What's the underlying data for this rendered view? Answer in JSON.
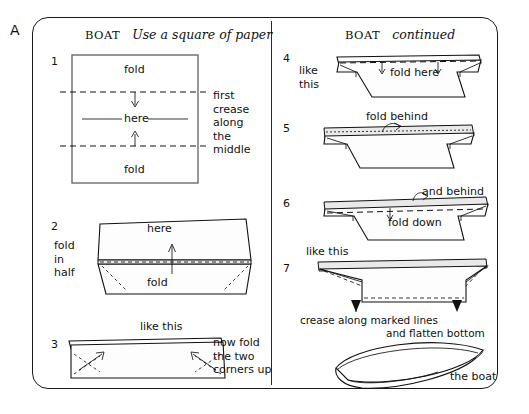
{
  "figure": {
    "label": "A",
    "type": "instructional-diagram"
  },
  "left_page": {
    "header": {
      "name": "BOAT",
      "subtitle": "Use a square of paper"
    },
    "steps": [
      {
        "number": "1",
        "diagram": "square-sheet-with-two-fold-lines",
        "labels": [
          {
            "text": "fold",
            "role": "top-fold-label"
          },
          {
            "text": "here",
            "role": "middle-crease-label"
          },
          {
            "text": "fold",
            "role": "bottom-fold-label"
          }
        ],
        "side_note": "first\ncrease\nalong\nthe\nmiddle"
      },
      {
        "number": "2",
        "diagram": "folded-in-half-strip",
        "side_note": "fold\nin\nhalf",
        "labels": [
          {
            "text": "here",
            "role": "upper-label"
          },
          {
            "text": "fold",
            "role": "lower-label"
          }
        ]
      },
      {
        "number": "3",
        "diagram": "flat-strip-with-corner-arrows",
        "caption_above": "like this",
        "side_note": "now fold\nthe two\ncorners up"
      }
    ]
  },
  "right_page": {
    "header": {
      "name": "BOAT",
      "subtitle": "continued"
    },
    "steps": [
      {
        "number": "4",
        "diagram": "boat-shape-with-top-fold-line",
        "side_note": "like\nthis",
        "labels": [
          {
            "text": "fold here",
            "role": "fold-instruction"
          }
        ]
      },
      {
        "number": "5",
        "diagram": "boat-shape-flat-top",
        "labels": [
          {
            "text": "fold behind",
            "role": "fold-instruction"
          }
        ]
      },
      {
        "number": "6",
        "diagram": "boat-shape-with-flap",
        "labels": [
          {
            "text": "and behind",
            "role": "fold-instruction"
          },
          {
            "text": "fold down",
            "role": "fold-instruction"
          }
        ]
      },
      {
        "number": "7",
        "diagram": "boat-shape-creased",
        "caption_above": "like this",
        "labels": [
          {
            "text": "crease along marked lines",
            "role": "crease-instruction"
          },
          {
            "text": "and flatten bottom",
            "role": "flatten-instruction"
          }
        ]
      }
    ],
    "final": {
      "caption": "the boat",
      "diagram": "finished-paper-boat"
    }
  },
  "colors": {
    "ink": "#111111",
    "page_border": "#1a1a1a",
    "square_border": "#6b6b6b",
    "paper_fill": "#fdfdfd",
    "shade": "#e9e9e9"
  }
}
